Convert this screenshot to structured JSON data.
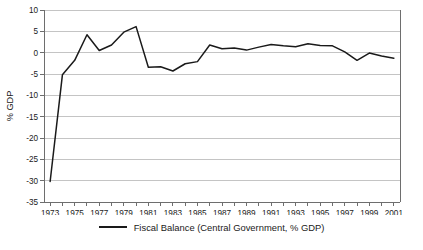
{
  "chart_data": {
    "type": "line",
    "title": "",
    "xlabel": "",
    "ylabel": "% GDP",
    "xlim": [
      1972.5,
      2001.5
    ],
    "ylim": [
      -35,
      10
    ],
    "ytick_step": 5,
    "grid": true,
    "grid_axis": "y",
    "legend_position": "bottom-center",
    "x_tick_labels": [
      "1973",
      "1975",
      "1977",
      "1979",
      "1981",
      "1983",
      "1985",
      "1987",
      "1989",
      "1991",
      "1993",
      "1995",
      "1997",
      "1999",
      "2001"
    ],
    "y_tick_labels": [
      "10",
      "5",
      "0",
      "-5",
      "-10",
      "-15",
      "-20",
      "-25",
      "-30",
      "-35"
    ],
    "y_ticks": [
      10,
      5,
      0,
      -5,
      -10,
      -15,
      -20,
      -25,
      -30,
      -35
    ],
    "x": [
      1973,
      1974,
      1975,
      1976,
      1977,
      1978,
      1979,
      1980,
      1981,
      1982,
      1983,
      1984,
      1985,
      1986,
      1987,
      1988,
      1989,
      1990,
      1991,
      1992,
      1993,
      1994,
      1995,
      1996,
      1997,
      1998,
      1999,
      2000,
      2001
    ],
    "series": [
      {
        "name": "Fiscal Balance (Central Government, % GDP)",
        "color": "#1a1a1a",
        "values": [
          -30.2,
          -5.2,
          -1.8,
          4.2,
          0.5,
          1.8,
          4.8,
          6.1,
          -3.4,
          -3.3,
          -4.3,
          -2.6,
          -2.1,
          1.8,
          0.9,
          1.1,
          0.6,
          1.3,
          1.9,
          1.6,
          1.4,
          2.1,
          1.7,
          1.6,
          0.2,
          -1.8,
          -0.1,
          -0.8,
          -1.3
        ]
      }
    ]
  },
  "legend": {
    "entries": [
      {
        "label": "Fiscal Balance (Central Government, % GDP)",
        "color": "#1a1a1a"
      }
    ]
  },
  "axis": {
    "y_label": "% GDP"
  },
  "colors": {
    "line": "#1a1a1a",
    "grid": "#b5b5b5",
    "axis": "#6e6e6e",
    "background": "#ffffff"
  }
}
